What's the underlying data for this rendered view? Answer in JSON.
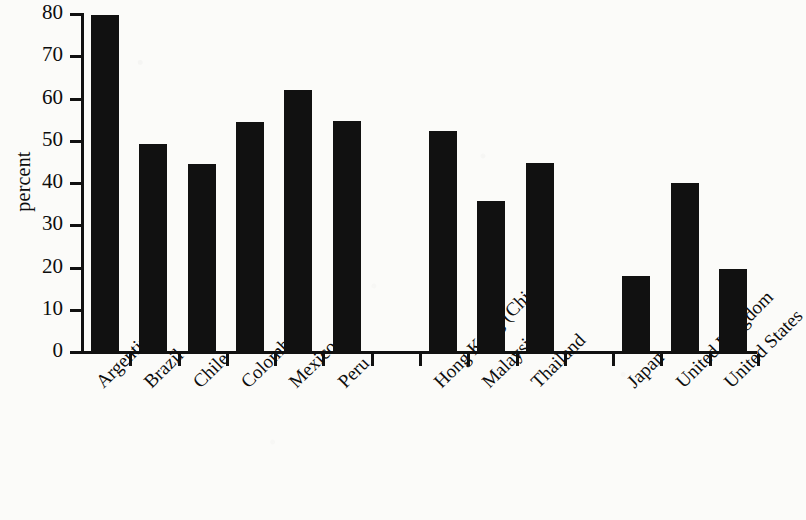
{
  "chart_data": {
    "type": "bar",
    "title": "",
    "subtitle": "",
    "xlabel": "",
    "ylabel": "percent",
    "ylim": [
      0,
      80
    ],
    "yticks": [
      0,
      10,
      20,
      30,
      40,
      50,
      60,
      70,
      80
    ],
    "ytick_labels": [
      "0",
      "10",
      "20",
      "30",
      "40",
      "50",
      "60",
      "70",
      "80"
    ],
    "grid": false,
    "legend": "none",
    "categories": [
      "Argentina",
      "Brazil",
      "Chile",
      "Colombia",
      "Mexico",
      "Peru",
      "",
      "Hong Kong (China)",
      "Malaysia",
      "Thailand",
      "",
      "Japan",
      "United Kingdom",
      "United States"
    ],
    "values": [
      79.5,
      49.0,
      44.3,
      54.2,
      61.8,
      54.4,
      null,
      52.0,
      35.6,
      44.4,
      null,
      17.8,
      39.7,
      19.3
    ],
    "bars": [
      {
        "label": "Argentina",
        "value": 79.5
      },
      {
        "label": "Brazil",
        "value": 49.0
      },
      {
        "label": "Chile",
        "value": 44.3
      },
      {
        "label": "Colombia",
        "value": 54.2
      },
      {
        "label": "Mexico",
        "value": 61.8
      },
      {
        "label": "Peru",
        "value": 54.4
      },
      {
        "label": "",
        "value": null
      },
      {
        "label": "Hong Kong (China)",
        "value": 52.0
      },
      {
        "label": "Malaysia",
        "value": 35.6
      },
      {
        "label": "Thailand",
        "value": 44.4
      },
      {
        "label": "",
        "value": null
      },
      {
        "label": "Japan",
        "value": 17.8
      },
      {
        "label": "United Kingdom",
        "value": 39.7
      },
      {
        "label": "United States",
        "value": 19.3
      }
    ],
    "bar_color": "#111111",
    "axis_color": "#111111",
    "background_color": "#fbfbf9"
  }
}
